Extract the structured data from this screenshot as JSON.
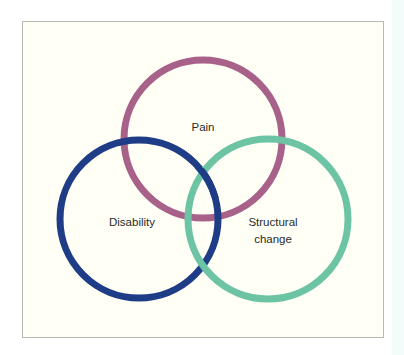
{
  "diagram": {
    "type": "venn",
    "circles": [
      {
        "id": "pain",
        "label": "Pain",
        "color": "#a8628a"
      },
      {
        "id": "disability",
        "label": "Disability",
        "color": "#1e3d86"
      },
      {
        "id": "structural",
        "label_line1": "Structural",
        "label_line2": "change",
        "color": "#6cc4a4"
      }
    ],
    "background": "#fffff6",
    "frame_border": "#b8b8b4"
  }
}
